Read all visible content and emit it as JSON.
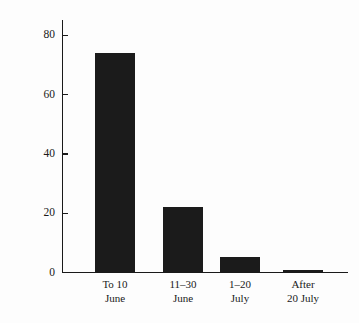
{
  "chart_data": {
    "type": "bar",
    "title": "",
    "subtitle": "",
    "xlabel": "",
    "ylabel": "Percent Attempting Second Brood",
    "categories": [
      "To 10 June",
      "11–30 June",
      "1–20 July",
      "After 20 July"
    ],
    "category_lines": [
      [
        "To 10",
        "June"
      ],
      [
        "11–30",
        "June"
      ],
      [
        "1–20",
        "July"
      ],
      [
        "After",
        "20 July"
      ]
    ],
    "values": [
      74,
      22,
      5,
      0.5
    ],
    "ylim": [
      0,
      85
    ],
    "yticks": [
      0,
      20,
      40,
      60,
      80
    ],
    "ytick_labels": [
      "0",
      "20",
      "40",
      "60",
      "80"
    ],
    "grid": false,
    "legend": null,
    "bar_color": "#1b1b1b",
    "axis_color": "#1a1a1a",
    "background_color": "#fdfdfd"
  }
}
